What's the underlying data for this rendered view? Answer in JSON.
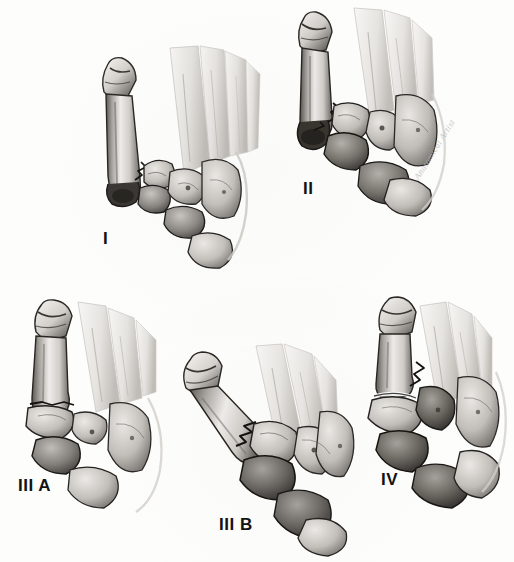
{
  "figure": {
    "medium": "graphite pencil anatomical illustration",
    "background_color": "#fdfdfc",
    "ink_color": "#131313",
    "bone_light": "#efedea",
    "bone_mid": "#b9b6b1",
    "bone_dark": "#4a4744",
    "shadow_color": "#262422",
    "panel_count": 5,
    "rows": 2,
    "signature": "Anatomical Artist"
  },
  "panels": [
    {
      "id": "panel-1",
      "label": "I",
      "label_x": 103,
      "label_y": 230,
      "row": 1,
      "column": 1,
      "description": "Dorsoplantar view of forefoot with first metatarsal and proximal phalanx, fracture line at first metatarsal base, tarsal bones intact",
      "bones": [
        "proximal phalanx",
        "first metatarsal",
        "second metatarsal",
        "third metatarsal",
        "fourth metatarsal",
        "fifth metatarsal",
        "medial cuneiform",
        "intermediate cuneiform",
        "lateral cuneiform",
        "cuboid",
        "navicular"
      ],
      "fracture_sites": [
        "first metatarsal base"
      ],
      "displacement": "none"
    },
    {
      "id": "panel-2",
      "label": "II",
      "label_x": 303,
      "label_y": 180,
      "row": 1,
      "column": 2,
      "description": "Fracture of first metatarsal base with medial cuneiform involvement and early lateral displacement",
      "bones": [
        "proximal phalanx",
        "first metatarsal",
        "lesser metatarsals",
        "medial cuneiform",
        "intermediate cuneiform",
        "cuboid",
        "navicular"
      ],
      "fracture_sites": [
        "first metatarsal base",
        "medial cuneiform"
      ],
      "displacement": "mild lateral"
    },
    {
      "id": "panel-3a",
      "label": "III A",
      "label_x": 18,
      "label_y": 477,
      "row": 2,
      "column": 1,
      "description": "Transverse fracture at first metatarsal base with plantar comminution of cuneiform complex",
      "bones": [
        "proximal phalanx",
        "first metatarsal",
        "lesser metatarsals",
        "medial cuneiform",
        "intermediate cuneiform",
        "cuboid"
      ],
      "fracture_sites": [
        "first metatarsal base",
        "cuneiform complex"
      ],
      "displacement": "moderate plantar"
    },
    {
      "id": "panel-3b",
      "label": "III B",
      "label_x": 219,
      "label_y": 516,
      "row": 2,
      "column": 2,
      "description": "Oblique comminuted fracture of first metatarsal base with marked angulation of the first ray",
      "bones": [
        "proximal phalanx",
        "first metatarsal",
        "lesser metatarsals",
        "medial cuneiform",
        "lateral cuneiform",
        "cuboid"
      ],
      "fracture_sites": [
        "first metatarsal base",
        "tarsometatarsal joint"
      ],
      "displacement": "marked medial angulation"
    },
    {
      "id": "panel-4",
      "label": "IV",
      "label_x": 381,
      "label_y": 471,
      "row": 2,
      "column": 3,
      "description": "Complete disruption with dorsal dislocation of the first metatarsal base and multi-level comminution",
      "bones": [
        "proximal phalanx",
        "first metatarsal",
        "lesser metatarsals",
        "cuneiforms",
        "cuboid",
        "navicular"
      ],
      "fracture_sites": [
        "first metatarsal base",
        "tarsometatarsal joint",
        "cuneiform"
      ],
      "displacement": "complete dislocation"
    }
  ]
}
